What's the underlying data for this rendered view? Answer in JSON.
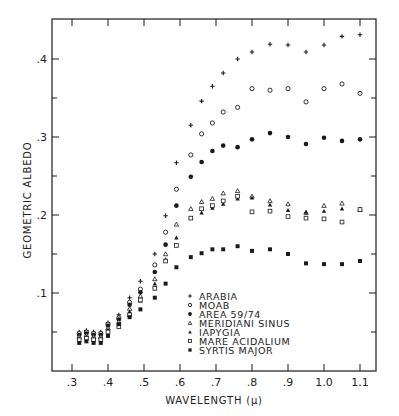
{
  "chart_data": {
    "type": "scatter",
    "title": "",
    "xlabel": "WAVELENGTH (μ)",
    "ylabel": "GEOMETRIC ALBEDO",
    "xlim": [
      0.28,
      1.14
    ],
    "ylim": [
      0.0,
      0.45
    ],
    "x_ticks": [
      0.3,
      0.4,
      0.5,
      0.6,
      0.7,
      0.8,
      0.9,
      1.0,
      1.1
    ],
    "x_tick_labels": [
      ".3",
      ".4",
      ".5",
      ".6",
      ".7",
      ".8",
      ".9",
      "1.0",
      "1.1"
    ],
    "y_ticks": [
      0.1,
      0.2,
      0.3,
      0.4
    ],
    "y_tick_labels": [
      ".1",
      ".2",
      ".3",
      ".4"
    ],
    "y_minor_ticks": [
      0.05,
      0.15,
      0.25,
      0.35
    ],
    "grid": false,
    "legend_position": "lower center (inside plot)",
    "series": [
      {
        "name": "ARABIA",
        "marker": "plus",
        "x": [
          0.32,
          0.34,
          0.36,
          0.38,
          0.4,
          0.43,
          0.46,
          0.49,
          0.53,
          0.56,
          0.59,
          0.63,
          0.66,
          0.69,
          0.72,
          0.76,
          0.8,
          0.85,
          0.9,
          0.95,
          1.0,
          1.05,
          1.1
        ],
        "y": [
          0.05,
          0.052,
          0.05,
          0.05,
          0.062,
          0.072,
          0.094,
          0.115,
          0.15,
          0.199,
          0.267,
          0.315,
          0.346,
          0.365,
          0.382,
          0.4,
          0.409,
          0.419,
          0.418,
          0.409,
          0.418,
          0.429,
          0.431
        ]
      },
      {
        "name": "MOAB",
        "marker": "circle-open",
        "x": [
          0.32,
          0.34,
          0.36,
          0.38,
          0.4,
          0.43,
          0.46,
          0.49,
          0.53,
          0.56,
          0.59,
          0.63,
          0.66,
          0.69,
          0.72,
          0.76,
          0.8,
          0.85,
          0.9,
          0.95,
          1.0,
          1.05,
          1.1
        ],
        "y": [
          0.048,
          0.05,
          0.048,
          0.048,
          0.06,
          0.068,
          0.088,
          0.105,
          0.136,
          0.178,
          0.233,
          0.277,
          0.304,
          0.318,
          0.332,
          0.338,
          0.362,
          0.36,
          0.362,
          0.345,
          0.362,
          0.368,
          0.356
        ]
      },
      {
        "name": "AREA 59/74",
        "marker": "circle-filled",
        "x": [
          0.32,
          0.34,
          0.36,
          0.38,
          0.4,
          0.43,
          0.46,
          0.49,
          0.53,
          0.56,
          0.59,
          0.63,
          0.66,
          0.69,
          0.72,
          0.76,
          0.8,
          0.85,
          0.9,
          0.95,
          1.0,
          1.05,
          1.1
        ],
        "y": [
          0.046,
          0.048,
          0.046,
          0.046,
          0.058,
          0.066,
          0.085,
          0.101,
          0.127,
          0.162,
          0.212,
          0.249,
          0.268,
          0.282,
          0.289,
          0.287,
          0.297,
          0.305,
          0.3,
          0.291,
          0.299,
          0.295,
          0.297
        ]
      },
      {
        "name": "MERIDIANI SINUS",
        "marker": "triangle-open",
        "x": [
          0.32,
          0.34,
          0.36,
          0.38,
          0.4,
          0.43,
          0.46,
          0.49,
          0.53,
          0.56,
          0.59,
          0.63,
          0.66,
          0.69,
          0.72,
          0.76,
          0.8,
          0.85,
          0.9,
          0.95,
          1.0,
          1.05,
          1.1
        ],
        "y": [
          0.044,
          0.046,
          0.044,
          0.044,
          0.055,
          0.063,
          0.08,
          0.096,
          0.118,
          0.15,
          0.188,
          0.208,
          0.217,
          0.221,
          0.228,
          0.231,
          0.224,
          0.218,
          0.214,
          0.203,
          0.212,
          0.215,
          0.207
        ]
      },
      {
        "name": "IAPYGIA",
        "marker": "triangle-filled",
        "x": [
          0.32,
          0.34,
          0.36,
          0.38,
          0.4,
          0.43,
          0.46,
          0.49,
          0.53,
          0.56,
          0.59,
          0.63,
          0.66,
          0.69,
          0.72,
          0.76,
          0.8,
          0.85,
          0.9,
          0.95,
          1.0,
          1.05,
          1.1
        ],
        "y": [
          0.042,
          0.044,
          0.042,
          0.042,
          0.053,
          0.06,
          0.076,
          0.09,
          0.112,
          0.143,
          0.171,
          0.196,
          0.203,
          0.209,
          0.214,
          0.221,
          0.222,
          0.213,
          0.206,
          0.204,
          0.205,
          0.208,
          0.208
        ]
      },
      {
        "name": "MARE ACIDALIUM",
        "marker": "square-open",
        "x": [
          0.32,
          0.34,
          0.36,
          0.38,
          0.4,
          0.43,
          0.46,
          0.49,
          0.53,
          0.56,
          0.59,
          0.63,
          0.66,
          0.69,
          0.72,
          0.76,
          0.8,
          0.85,
          0.9,
          0.95,
          1.0,
          1.05,
          1.1
        ],
        "y": [
          0.04,
          0.042,
          0.04,
          0.04,
          0.05,
          0.057,
          0.072,
          0.091,
          0.106,
          0.141,
          0.161,
          0.196,
          0.208,
          0.212,
          0.218,
          0.224,
          0.204,
          0.205,
          0.198,
          0.196,
          0.195,
          0.191,
          0.207
        ]
      },
      {
        "name": "SYRTIS MAJOR",
        "marker": "square-filled",
        "x": [
          0.32,
          0.34,
          0.36,
          0.38,
          0.4,
          0.43,
          0.46,
          0.49,
          0.53,
          0.56,
          0.59,
          0.63,
          0.66,
          0.69,
          0.72,
          0.76,
          0.8,
          0.85,
          0.9,
          0.95,
          1.0,
          1.05,
          1.1
        ],
        "y": [
          0.036,
          0.038,
          0.036,
          0.036,
          0.045,
          0.06,
          0.069,
          0.079,
          0.094,
          0.112,
          0.133,
          0.146,
          0.151,
          0.156,
          0.156,
          0.16,
          0.154,
          0.156,
          0.15,
          0.138,
          0.137,
          0.137,
          0.141
        ]
      }
    ]
  },
  "legend": {
    "items": [
      {
        "label": "ARABIA",
        "marker": "plus"
      },
      {
        "label": "MOAB",
        "marker": "circle-open"
      },
      {
        "label": "AREA 59/74",
        "marker": "circle-filled"
      },
      {
        "label": "MERIDIANI SINUS",
        "marker": "triangle-open"
      },
      {
        "label": "IAPYGIA",
        "marker": "triangle-filled"
      },
      {
        "label": "MARE ACIDALIUM",
        "marker": "square-open"
      },
      {
        "label": "SYRTIS MAJOR",
        "marker": "square-filled"
      }
    ]
  },
  "colors": {
    "ink": "#1a1a1a",
    "background": "#ffffff"
  }
}
